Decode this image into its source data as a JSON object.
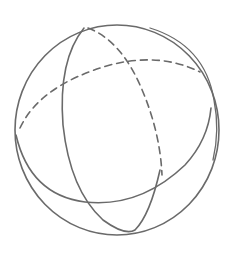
{
  "figure": {
    "style": "pencil drawing",
    "stroke_color": "#6a6a6a",
    "background_color": "#ffffff",
    "elements": [
      {
        "name": "outer-circle",
        "line": "solid"
      },
      {
        "name": "equator-front",
        "line": "solid"
      },
      {
        "name": "equator-back",
        "line": "dashed"
      },
      {
        "name": "meridian-front",
        "line": "solid"
      },
      {
        "name": "meridian-back",
        "line": "dashed"
      }
    ]
  }
}
